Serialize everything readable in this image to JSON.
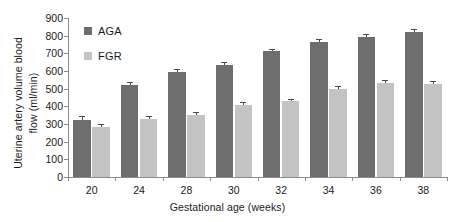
{
  "chart_data": {
    "type": "bar",
    "title": "",
    "xlabel": "Gestational age (weeks)",
    "ylabel": "Uterine artery volume blood flow (ml/min)",
    "ylabel_lines": [
      "Uterine artery volume blood",
      "flow (ml/min)"
    ],
    "categories": [
      "20",
      "24",
      "28",
      "30",
      "32",
      "34",
      "36",
      "38"
    ],
    "ylim": [
      0,
      900
    ],
    "yticks": [
      0,
      100,
      200,
      300,
      400,
      500,
      600,
      700,
      800,
      900
    ],
    "ytick_labels": [
      "0",
      "100",
      "200",
      "300",
      "400",
      "500",
      "600",
      "700",
      "800",
      "900"
    ],
    "grid": false,
    "legend_position": "top-left",
    "series": [
      {
        "name": "AGA",
        "color": "#6e6e6e",
        "values": [
          325,
          522,
          595,
          635,
          712,
          765,
          792,
          820
        ],
        "errors": [
          14,
          12,
          10,
          11,
          9,
          11,
          10,
          11
        ]
      },
      {
        "name": "FGR",
        "color": "#c3c3c3",
        "values": [
          282,
          330,
          352,
          408,
          428,
          500,
          530,
          525
        ],
        "errors": [
          13,
          12,
          12,
          11,
          10,
          10,
          11,
          11
        ]
      }
    ]
  },
  "legend": {
    "items": [
      {
        "label": "AGA",
        "color": "#6e6e6e"
      },
      {
        "label": "FGR",
        "color": "#c3c3c3"
      }
    ]
  },
  "axes": {
    "y_title_line1": "Uterine artery volume blood",
    "y_title_line2": "flow (ml/min)",
    "x_title": "Gestational age (weeks)"
  },
  "colors": {
    "aga": "#6e6e6e",
    "fgr": "#c3c3c3",
    "axis": "#8c8c8c",
    "text": "#1a1a1a",
    "background": "#ffffff"
  }
}
